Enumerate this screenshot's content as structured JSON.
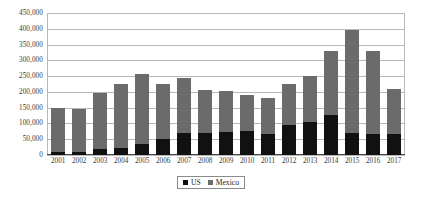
{
  "chart_data": {
    "type": "bar",
    "stacked": true,
    "title": "",
    "xlabel": "",
    "ylabel": "",
    "ylim": [
      0,
      450000
    ],
    "ytick_step": 50000,
    "grid": true,
    "legend_position": "bottom",
    "categories": [
      "2001",
      "2002",
      "2003",
      "2004",
      "2005",
      "2006",
      "2007",
      "2008",
      "2009",
      "2010",
      "2011",
      "2012",
      "2013",
      "2014",
      "2015",
      "2016",
      "2017"
    ],
    "ytick_labels": [
      "0",
      "50,000",
      "100,000",
      "150,000",
      "200,000",
      "250,000",
      "300,000",
      "350,000",
      "400,000",
      "450,000"
    ],
    "ytick_values": [
      0,
      50000,
      100000,
      150000,
      200000,
      250000,
      300000,
      350000,
      400000,
      450000
    ],
    "series": [
      {
        "name": "US",
        "color": "#111111",
        "values": [
          11000,
          11000,
          19000,
          23000,
          34000,
          51000,
          70000,
          70000,
          72000,
          75000,
          68000,
          95000,
          105000,
          128000,
          70000,
          68000,
          68000
        ]
      },
      {
        "name": "Mexico",
        "color": "#6b6b6b",
        "values": [
          137000,
          136000,
          176000,
          202000,
          222000,
          174000,
          175000,
          135000,
          130000,
          115000,
          114000,
          130000,
          147000,
          202000,
          325000,
          262000,
          142000
        ]
      }
    ],
    "totals": [
      148000,
      147000,
      195000,
      225000,
      256000,
      225000,
      245000,
      205000,
      202000,
      190000,
      182000,
      225000,
      252000,
      330000,
      395000,
      330000,
      210000
    ]
  }
}
